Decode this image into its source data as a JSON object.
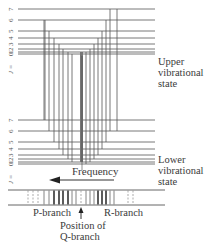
{
  "diagram": {
    "upper_state": {
      "label_lines": [
        "Upper",
        "vibrational",
        "state"
      ],
      "j_axis_label": "J = 0 1 2 3 4 5 6 7",
      "levels": [
        {
          "j": 7,
          "y": 9
        },
        {
          "j": 6,
          "y": 20
        },
        {
          "j": 5,
          "y": 31
        },
        {
          "j": 4,
          "y": 38
        },
        {
          "j": 3,
          "y": 44
        },
        {
          "j": 2,
          "y": 49
        },
        {
          "j": 1,
          "y": 52
        },
        {
          "j": 0,
          "y": 54
        }
      ]
    },
    "lower_state": {
      "label_lines": [
        "Lower",
        "vibrational",
        "state"
      ],
      "j_axis_label": "J = 0 1 2 3 4 5 6 7",
      "levels": [
        {
          "j": 7,
          "y": 120
        },
        {
          "j": 6,
          "y": 131
        },
        {
          "j": 5,
          "y": 142
        },
        {
          "j": 4,
          "y": 149
        },
        {
          "j": 3,
          "y": 155
        },
        {
          "j": 2,
          "y": 159
        },
        {
          "j": 1,
          "y": 162
        },
        {
          "j": 0,
          "y": 164
        }
      ]
    },
    "frequency_label": "Frequency",
    "frequency_arrow_direction": "left",
    "spectrum": {
      "p_branch_label": "P-branch",
      "r_branch_label": "R-branch",
      "q_position_label_lines": [
        "Position of",
        "Q-branch"
      ],
      "p_lines": [
        {
          "x": 28,
          "style": "dashed"
        },
        {
          "x": 33,
          "style": "dashed"
        },
        {
          "x": 38,
          "style": "dashed"
        },
        {
          "x": 44,
          "style": "thin"
        },
        {
          "x": 49,
          "style": "thin"
        },
        {
          "x": 54,
          "style": "bold"
        },
        {
          "x": 59,
          "style": "bold"
        },
        {
          "x": 63,
          "style": "bold"
        },
        {
          "x": 68,
          "style": "bold"
        },
        {
          "x": 72,
          "style": "thin"
        },
        {
          "x": 76,
          "style": "thin"
        }
      ],
      "q_line": {
        "x": 81,
        "style": "dashed"
      },
      "r_lines": [
        {
          "x": 86,
          "style": "thin"
        },
        {
          "x": 90,
          "style": "thin"
        },
        {
          "x": 94,
          "style": "thin"
        },
        {
          "x": 98,
          "style": "bold"
        },
        {
          "x": 102,
          "style": "bold"
        },
        {
          "x": 106,
          "style": "bold"
        },
        {
          "x": 110,
          "style": "thin"
        },
        {
          "x": 114,
          "style": "thin"
        },
        {
          "x": 128,
          "style": "dashed"
        },
        {
          "x": 133,
          "style": "dashed"
        }
      ]
    },
    "colors": {
      "line": "#555555",
      "text": "#3a3a3a",
      "q_branch": "#777777"
    }
  }
}
